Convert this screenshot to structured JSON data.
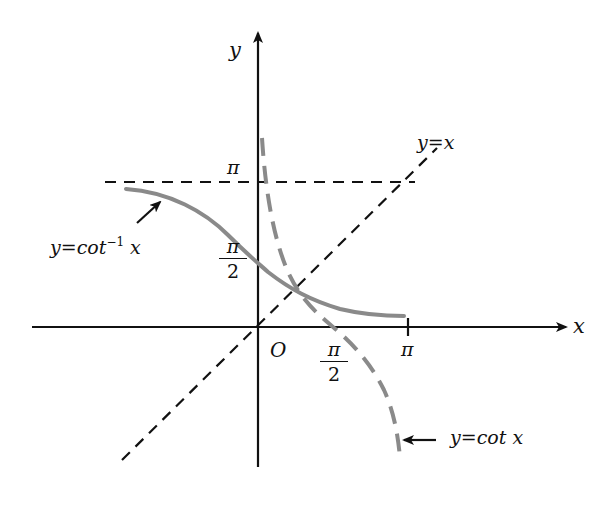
{
  "diagram": {
    "axes": {
      "x_label": "x",
      "y_label": "y",
      "origin_label": "O"
    },
    "ticks": {
      "x_pi_half": {
        "num": "π",
        "den": "2"
      },
      "x_pi": "π",
      "y_pi": "π",
      "y_pi_half": {
        "num": "π",
        "den": "2"
      }
    },
    "curves": {
      "arccot": {
        "label_pre": "y=cot",
        "label_sup": "−1",
        "label_post": " x",
        "style": "solid",
        "color": "#8a8a8a"
      },
      "cot": {
        "label_pre": "y=cot",
        "label_post": " x",
        "style": "dashed",
        "color": "#8a8a8a"
      },
      "identity": {
        "label": "y=x",
        "style": "dashed",
        "color": "#111111"
      },
      "asymptote_pi": {
        "style": "dashed",
        "color": "#111111"
      }
    },
    "colors": {
      "axis": "#111111",
      "curve_gray": "#8a8a8a",
      "background": "#ffffff"
    }
  }
}
